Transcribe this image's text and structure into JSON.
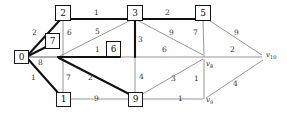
{
  "figure": {
    "name": "weighted-graph-diagram",
    "colors": {
      "edge_thin": "#8a8a8a",
      "edge_bold": "#111111",
      "node_border": "#1a1a1a",
      "background": "#ffffff",
      "text": "#222222"
    }
  },
  "nodes": [
    {
      "id": "n0",
      "label": "0",
      "x": 22,
      "y": 57,
      "boxed": true,
      "bold": false
    },
    {
      "id": "n2",
      "label": "2",
      "x": 63,
      "y": 13,
      "boxed": true,
      "bold": true
    },
    {
      "id": "n3",
      "label": "3",
      "x": 135,
      "y": 13,
      "boxed": true,
      "bold": true
    },
    {
      "id": "n5",
      "label": "5",
      "x": 203,
      "y": 13,
      "boxed": true,
      "bold": true
    },
    {
      "id": "n7",
      "label": "7",
      "x": 52,
      "y": 41,
      "boxed": true,
      "bold": true
    },
    {
      "id": "n6",
      "label": "6",
      "x": 113,
      "y": 49,
      "boxed": true,
      "bold": true
    },
    {
      "id": "n1",
      "label": "1",
      "x": 63,
      "y": 99,
      "boxed": true,
      "bold": false
    },
    {
      "id": "n9",
      "label": "9",
      "x": 135,
      "y": 99,
      "boxed": true,
      "bold": false
    },
    {
      "id": "n4",
      "label": "v8",
      "sub": "8",
      "x": 205,
      "y": 57,
      "boxed": false,
      "bold": false
    },
    {
      "id": "n8",
      "label": "v9",
      "sub": "9",
      "x": 205,
      "y": 99,
      "boxed": false,
      "bold": false
    },
    {
      "id": "n10",
      "label": "v10",
      "sub": "10",
      "x": 268,
      "y": 57,
      "boxed": false,
      "bold": false
    }
  ],
  "node_labels": {
    "n0": "0",
    "n2": "2",
    "n3": "3",
    "n5": "5",
    "n7": "7",
    "n6": "6",
    "n1": "1",
    "n9": "9",
    "v8": "v",
    "v9": "v",
    "v10": "v",
    "v8_sub": "8",
    "v9_sub": "9",
    "v10_sub": "10"
  },
  "edges": [
    {
      "from": "n0",
      "to": "n2",
      "weight": "2",
      "bold": true,
      "lx": 35,
      "ly": 33
    },
    {
      "from": "n0",
      "to": "n7",
      "weight": "7",
      "bold": false,
      "lx": 52,
      "ly": 41
    },
    {
      "from": "n0",
      "to": "n6",
      "weight": "8",
      "bold": false,
      "lx": 41,
      "ly": 62
    },
    {
      "from": "n0",
      "to": "n1",
      "weight": "1",
      "bold": true,
      "lx": 34,
      "ly": 77
    },
    {
      "from": "n2",
      "to": "n3",
      "weight": "1",
      "bold": true,
      "lx": 97,
      "ly": 12
    },
    {
      "from": "n2",
      "to": "n7",
      "weight": "6",
      "bold": false,
      "lx": 71,
      "ly": 33
    },
    {
      "from": "n3",
      "to": "n7",
      "weight": "5",
      "bold": false,
      "lx": 98,
      "ly": 32
    },
    {
      "from": "n3",
      "to": "n6",
      "weight": "1",
      "bold": false,
      "lx": 98,
      "ly": 50
    },
    {
      "from": "n3",
      "to": "n5",
      "weight": "2",
      "bold": true,
      "lx": 168,
      "ly": 12
    },
    {
      "from": "n3",
      "to": "n9",
      "weight": "3",
      "bold": true,
      "lx": 141,
      "ly": 39
    },
    {
      "from": "n3",
      "to": "n4",
      "weight": "9",
      "bold": false,
      "lx": 172,
      "ly": 32
    },
    {
      "from": "n5",
      "to": "n4",
      "weight": "7",
      "bold": false,
      "lx": 196,
      "ly": 32
    },
    {
      "from": "n5",
      "to": "n10",
      "weight": "9",
      "bold": false,
      "lx": 238,
      "ly": 32
    },
    {
      "from": "n6",
      "to": "n4",
      "weight": "6",
      "bold": false,
      "lx": 165,
      "ly": 50
    },
    {
      "from": "n6",
      "to": "n1",
      "weight": "7",
      "bold": false,
      "lx": 70,
      "ly": 77
    },
    {
      "from": "n6",
      "to": "n9",
      "weight": "2",
      "bold": true,
      "lx": 91,
      "ly": 77
    },
    {
      "from": "n6",
      "to": "n10",
      "weight": "2",
      "bold": false,
      "lx": 233,
      "ly": 50
    },
    {
      "from": "n1",
      "to": "n9",
      "weight": "9",
      "bold": false,
      "lx": 97,
      "ly": 98
    },
    {
      "from": "n9",
      "to": "n3b",
      "weight": "4",
      "bold": false,
      "lx": 142,
      "ly": 77
    },
    {
      "from": "n9",
      "to": "n4",
      "weight": "3",
      "bold": false,
      "lx": 174,
      "ly": 78
    },
    {
      "from": "n9",
      "to": "n8",
      "weight": "1",
      "bold": false,
      "lx": 181,
      "ly": 98
    },
    {
      "from": "n4",
      "to": "n8",
      "weight": "1",
      "bold": false,
      "lx": 197,
      "ly": 78
    },
    {
      "from": "n8",
      "to": "n10",
      "weight": "4",
      "bold": false,
      "lx": 237,
      "ly": 83
    }
  ],
  "weights_list": [
    "2",
    "7",
    "8",
    "1",
    "1",
    "6",
    "5",
    "1",
    "2",
    "3",
    "9",
    "7",
    "9",
    "6",
    "7",
    "2",
    "2",
    "9",
    "4",
    "3",
    "1",
    "1",
    "4"
  ]
}
